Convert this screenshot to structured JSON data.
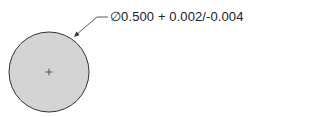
{
  "diagram": {
    "callout": {
      "symbol": "∅",
      "nominal": "0.500",
      "tolerance": "+ 0.002/-0.004",
      "full_text": "∅0.500 + 0.002/-0.004"
    },
    "circle": {
      "fill": "#d4d4d4",
      "stroke": "#333333",
      "center_mark": "+"
    }
  }
}
